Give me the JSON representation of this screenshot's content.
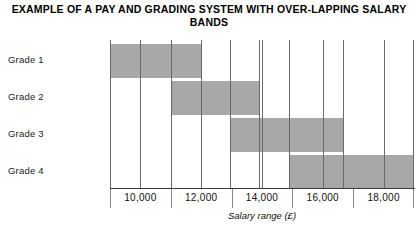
{
  "chart_data": {
    "type": "bar",
    "orientation": "horizontal",
    "title": "EXAMPLE OF A PAY AND GRADING SYSTEM WITH OVER-LAPPING SALARY BANDS",
    "xlabel": "Salary range (£)",
    "ylabel": "",
    "categories": [
      "Grade 1",
      "Grade 2",
      "Grade 3",
      "Grade 4"
    ],
    "bar_color": "#a8a8a8",
    "grid": true,
    "legend": "none",
    "xlim": [
      9000,
      19000
    ],
    "xticks": [
      10000,
      12000,
      14000,
      16000,
      18000
    ],
    "xtick_labels": [
      "10,000",
      "12,000",
      "14,000",
      "16,000",
      "18,000"
    ],
    "bands": [
      {
        "grade": "Grade 1",
        "start": 9000,
        "end": 12000,
        "start_label": "9,000",
        "end_label": "12,000"
      },
      {
        "grade": "Grade 2",
        "start": 11000,
        "end": 13900,
        "start_label": "11,000",
        "end_label": "13,900"
      },
      {
        "grade": "Grade 3",
        "start": 12950,
        "end": 16650,
        "start_label": "12,950",
        "end_label": "16,650"
      },
      {
        "grade": "Grade 4",
        "start": 14900,
        "end": 19000,
        "start_label": "14,900",
        "end_label": "19,000"
      }
    ]
  },
  "grades": [
    {
      "label": "Grade 1"
    },
    {
      "label": "Grade 2"
    },
    {
      "label": "Grade 3"
    },
    {
      "label": "Grade 4"
    }
  ],
  "ticks": [
    {
      "label": "10,000"
    },
    {
      "label": "12,000"
    },
    {
      "label": "14,000"
    },
    {
      "label": "16,000"
    },
    {
      "label": "18,000"
    }
  ]
}
